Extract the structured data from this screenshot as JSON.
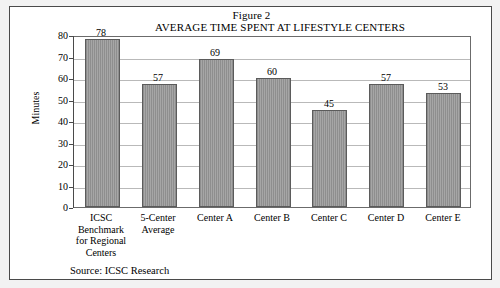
{
  "figure": {
    "label": "Figure 2",
    "title": "AVERAGE TIME SPENT AT LIFESTYLE CENTERS",
    "source": "Source: ICSC Research"
  },
  "chart_data": {
    "type": "bar",
    "title": "AVERAGE TIME SPENT AT LIFESTYLE CENTERS",
    "subtitle": "Figure 2",
    "xlabel": "",
    "ylabel": "Minutes",
    "ylim": [
      0,
      80
    ],
    "ytick_step": 10,
    "yticks": [
      80,
      70,
      60,
      50,
      40,
      30,
      20,
      10,
      0
    ],
    "grid": true,
    "legend": false,
    "categories": [
      "ICSC Benchmark for Regional Centers",
      "5-Center Average",
      "Center A",
      "Center B",
      "Center C",
      "Center D",
      "Center E"
    ],
    "category_lines": [
      [
        "ICSC",
        "Benchmark",
        "for Regional",
        "Centers"
      ],
      [
        "5-Center",
        "Average"
      ],
      [
        "Center A"
      ],
      [
        "Center B"
      ],
      [
        "Center C"
      ],
      [
        "Center D"
      ],
      [
        "Center E"
      ]
    ],
    "values": [
      78,
      57,
      69,
      60,
      45,
      57,
      53
    ],
    "value_labels": [
      "78",
      "57",
      "69",
      "60",
      "45",
      "57",
      "53"
    ],
    "annotations": [
      "Source: ICSC Research"
    ],
    "bar_color": "#9a9a9a",
    "bar_edge_color": "#5b5b5b",
    "grid_color": "#b9b9b9"
  }
}
